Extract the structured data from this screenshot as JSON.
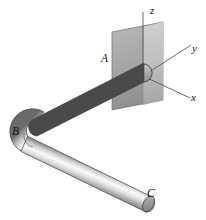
{
  "figure": {
    "background_color": "#ffffff"
  },
  "axes": {
    "origin_label": "",
    "items": [
      {
        "name": "z-axis",
        "label": "z",
        "direction": "up"
      },
      {
        "name": "y-axis",
        "label": "y",
        "direction": "up-right"
      },
      {
        "name": "x-axis",
        "label": "x",
        "direction": "down-right"
      }
    ],
    "z_label": "z",
    "y_label": "y",
    "x_label": "x",
    "line_color": "#5a5a5a"
  },
  "points": {
    "a_label": "A",
    "b_label": "B",
    "c_label": "C"
  },
  "wall": {
    "name": "wall-support-plate",
    "fill_light": "#c9c9c9",
    "fill_dark": "#9c9c9c",
    "edge_color": "#6f6f6f"
  },
  "pipe": {
    "name": "bent-pipe",
    "highlight_color": "#fbfbfb",
    "mid_color": "#a8a8a8",
    "shadow_color": "#4c4c4c",
    "outline_color": "#3c3c3c",
    "cap_color": "#8e8e8e",
    "segments": [
      {
        "name": "segment-AB",
        "from": "A",
        "to": "B"
      },
      {
        "name": "segment-BC",
        "from": "B",
        "to": "C"
      }
    ]
  }
}
